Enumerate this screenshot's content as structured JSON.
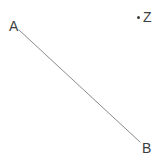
{
  "figure": {
    "kind": "geometry-diagram",
    "width": 165,
    "height": 164,
    "background_color": "#ffffff",
    "stroke_color": "#8a8a8a",
    "label_color": "#3d3d3d",
    "segments": [
      {
        "name": "segment-AB",
        "from": {
          "label": "A",
          "x": 19,
          "y": 30
        },
        "to": {
          "label": "B",
          "x": 140,
          "y": 142
        },
        "stroke_width": 1
      }
    ],
    "points": [
      {
        "name": "point-A",
        "label": "A",
        "x": 19,
        "y": 30,
        "dot_visible": false
      },
      {
        "name": "point-B",
        "label": "B",
        "x": 140,
        "y": 142,
        "dot_visible": false
      },
      {
        "name": "point-Z",
        "label": "Z",
        "x": 138,
        "y": 17,
        "dot_visible": true
      }
    ],
    "labels": {
      "a": "A",
      "b": "B",
      "z": "Z"
    }
  }
}
